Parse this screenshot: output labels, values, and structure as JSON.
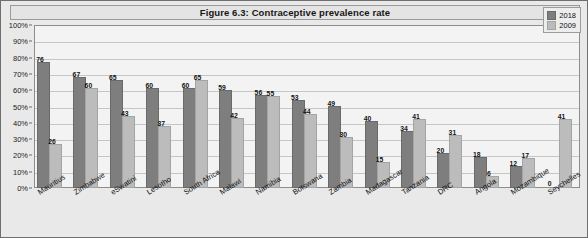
{
  "chart_data": {
    "type": "bar",
    "title": "Figure 6.3: Contraceptive prevalence rate",
    "xlabel": "",
    "ylabel": "",
    "ylim": [
      0,
      100
    ],
    "ytick_labels": [
      "100%",
      "90%",
      "80%",
      "70%",
      "60%",
      "50%",
      "40%",
      "30%",
      "20%",
      "10%",
      "0%"
    ],
    "ytick_values": [
      100,
      90,
      80,
      70,
      60,
      50,
      40,
      30,
      20,
      10,
      0
    ],
    "grid": true,
    "legend_position": "top-right",
    "categories": [
      "Mauritius",
      "Zimbabwe",
      "eSwatini",
      "Lesotho",
      "South Africa",
      "Malawi",
      "Namibia",
      "Botswana",
      "Zambia",
      "Madagascar",
      "Tanzania",
      "DRC",
      "Angola",
      "Mozambique",
      "Seychelles"
    ],
    "series": [
      {
        "name": "2018",
        "color": "#7e7e7e",
        "values": [
          76,
          67,
          65,
          60,
          60,
          59,
          56,
          53,
          49,
          40,
          34,
          20,
          18,
          12,
          0
        ]
      },
      {
        "name": "2009",
        "color": "#bcbcbc",
        "values": [
          26,
          60,
          43,
          37,
          65,
          42,
          55,
          44,
          30,
          15,
          41,
          31,
          6,
          17,
          41
        ]
      }
    ]
  },
  "legend": {
    "items": [
      {
        "label": "2018"
      },
      {
        "label": "2009"
      }
    ]
  }
}
